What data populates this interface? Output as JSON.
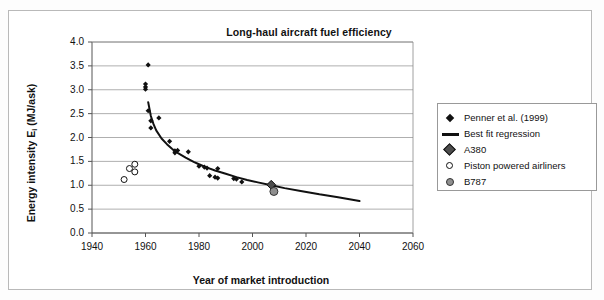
{
  "chart_data": {
    "type": "scatter",
    "title": "Long-haul aircraft fuel efficiency",
    "xlabel": "Year of market introduction",
    "ylabel": "Energy intensity Ei (MJ/ask)",
    "ylabel_main": "Energy intensity E",
    "ylabel_sub": "i",
    "ylabel_units": " (MJ/ask)",
    "xlim": [
      1940,
      2060
    ],
    "ylim": [
      0.0,
      4.0
    ],
    "xticks": [
      1940,
      1960,
      1980,
      2000,
      2020,
      2040,
      2060
    ],
    "yticks": [
      "0.0",
      "0.5",
      "1.0",
      "1.5",
      "2.0",
      "2.5",
      "3.0",
      "3.5",
      "4.0"
    ],
    "xtick_labels": [
      "1940",
      "1960",
      "1980",
      "2000",
      "2020",
      "2040",
      "2060"
    ],
    "grid": "horizontal",
    "legend_position": "right",
    "series": [
      {
        "name": "Penner et al. (1999)",
        "marker": "diamond-filled-small",
        "color": "#111111",
        "points": [
          [
            1961,
            3.52
          ],
          [
            1960,
            3.12
          ],
          [
            1960,
            3.06
          ],
          [
            1960,
            3.01
          ],
          [
            1961,
            2.56
          ],
          [
            1962,
            2.35
          ],
          [
            1965,
            2.41
          ],
          [
            1962,
            2.2
          ],
          [
            1969,
            1.92
          ],
          [
            1971,
            1.68
          ],
          [
            1971,
            1.72
          ],
          [
            1972,
            1.73
          ],
          [
            1976,
            1.7
          ],
          [
            1980,
            1.4
          ],
          [
            1982,
            1.38
          ],
          [
            1983,
            1.36
          ],
          [
            1987,
            1.35
          ],
          [
            1984,
            1.2
          ],
          [
            1986,
            1.17
          ],
          [
            1987,
            1.15
          ],
          [
            1993,
            1.14
          ],
          [
            1994,
            1.13
          ],
          [
            1996,
            1.07
          ]
        ]
      },
      {
        "name": "Best fit regression",
        "marker": "line",
        "color": "#111111",
        "curve_points": [
          [
            1961,
            2.74
          ],
          [
            1962,
            2.45
          ],
          [
            1963,
            2.28
          ],
          [
            1964,
            2.15
          ],
          [
            1966,
            1.98
          ],
          [
            1968,
            1.86
          ],
          [
            1970,
            1.76
          ],
          [
            1972,
            1.68
          ],
          [
            1975,
            1.58
          ],
          [
            1978,
            1.49
          ],
          [
            1980,
            1.44
          ],
          [
            1983,
            1.37
          ],
          [
            1986,
            1.31
          ],
          [
            1990,
            1.24
          ],
          [
            1994,
            1.17
          ],
          [
            1998,
            1.11
          ],
          [
            2002,
            1.06
          ],
          [
            2007,
            1.0
          ],
          [
            2012,
            0.94
          ],
          [
            2018,
            0.88
          ],
          [
            2025,
            0.81
          ],
          [
            2032,
            0.75
          ],
          [
            2040,
            0.67
          ]
        ]
      },
      {
        "name": "A380",
        "marker": "diamond-grey",
        "color": "#4d4d4d",
        "points": [
          [
            2007,
            1.01
          ]
        ]
      },
      {
        "name": "Piston powered airliners",
        "marker": "circle-open",
        "color": "#ffffff",
        "points": [
          [
            1952,
            1.12
          ],
          [
            1954,
            1.35
          ],
          [
            1956,
            1.44
          ],
          [
            1956,
            1.28
          ]
        ]
      },
      {
        "name": "B787",
        "marker": "circle-grey",
        "color": "#8f8f8f",
        "points": [
          [
            2008,
            0.87
          ]
        ]
      }
    ]
  },
  "legend": {
    "entries": [
      {
        "label": "Penner et al. (1999)",
        "marker": "diamond-small-icon"
      },
      {
        "label": "Best fit regression",
        "marker": "line-icon"
      },
      {
        "label": "A380",
        "marker": "diamond-grey-icon"
      },
      {
        "label": "Piston powered airliners",
        "marker": "circle-open-icon"
      },
      {
        "label": "B787",
        "marker": "circle-grey-icon"
      }
    ]
  },
  "colors": {
    "plot_border": "#888888",
    "gridline": "#9a9a9a",
    "marker_dark": "#111111",
    "marker_grey": "#8f8f8f",
    "frame": "#b9b9b9",
    "background": "#ffffff"
  }
}
